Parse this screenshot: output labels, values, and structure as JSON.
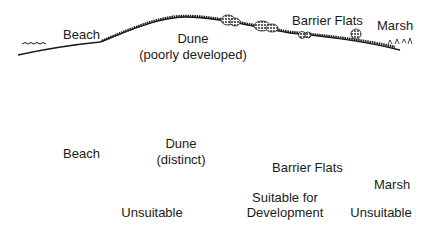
{
  "diagram": {
    "top_profile": {
      "labels": {
        "beach": "Beach",
        "dune_line1": "Dune",
        "dune_line2": "(poorly developed)",
        "barrier_flats": "Barrier Flats",
        "marsh": "Marsh"
      }
    },
    "bottom_profile": {
      "labels": {
        "beach": "Beach",
        "dune_line1": "Dune",
        "dune_line2": "(distinct)",
        "barrier_flats": "Barrier Flats",
        "marsh": "Marsh"
      }
    },
    "suitability": [
      {
        "label_line1": "Unsuitable",
        "label_line2": ""
      },
      {
        "label_line1": "Suitable for",
        "label_line2": "Development"
      },
      {
        "label_line1": "Unsuitable",
        "label_line2": ""
      }
    ],
    "colors": {
      "ink": "#1a1a1a",
      "background": "#ffffff"
    }
  }
}
